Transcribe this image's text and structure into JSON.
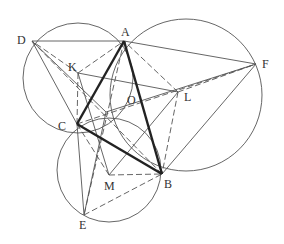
{
  "diagram": {
    "title": "",
    "colors": {
      "line": "#555555",
      "thick": "#222222",
      "text": "#333333",
      "background": "#ffffff"
    },
    "points": {
      "A": {
        "label": "A",
        "x": 124,
        "y": 41,
        "lx": 121,
        "ly": 36
      },
      "B": {
        "label": "B",
        "x": 162,
        "y": 174,
        "lx": 164,
        "ly": 188
      },
      "C": {
        "label": "C",
        "x": 77,
        "y": 124,
        "lx": 58,
        "ly": 130
      },
      "D": {
        "label": "D",
        "x": 32,
        "y": 41,
        "lx": 17,
        "ly": 44
      },
      "E": {
        "label": "E",
        "x": 84,
        "y": 215,
        "lx": 79,
        "ly": 229
      },
      "F": {
        "label": "F",
        "x": 256,
        "y": 64,
        "lx": 262,
        "ly": 68
      },
      "K": {
        "label": "K",
        "x": 78,
        "y": 73,
        "lx": 68,
        "ly": 71
      },
      "L": {
        "label": "L",
        "x": 178,
        "y": 92,
        "lx": 184,
        "ly": 101
      },
      "M": {
        "label": "M",
        "x": 109,
        "y": 175,
        "lx": 104,
        "ly": 190
      },
      "O": {
        "label": "O",
        "x": 106,
        "y": 112,
        "lx": 127,
        "ly": 104
      }
    },
    "circles": [
      {
        "name": "circle-ACD",
        "cx": 78,
        "cy": 78,
        "r": 55
      },
      {
        "name": "circle-ABF",
        "cx": 186,
        "cy": 95,
        "r": 76
      },
      {
        "name": "circle-BCE",
        "cx": 109,
        "cy": 170,
        "r": 52
      }
    ],
    "thick_segments": [
      [
        "A",
        "B"
      ],
      [
        "B",
        "C"
      ],
      [
        "C",
        "A"
      ]
    ],
    "solid_segments": [
      [
        "D",
        "A"
      ],
      [
        "A",
        "F"
      ],
      [
        "D",
        "C"
      ],
      [
        "C",
        "E"
      ],
      [
        "F",
        "B"
      ],
      [
        "K",
        "L"
      ],
      [
        "K",
        "M"
      ],
      [
        "M",
        "L"
      ],
      [
        "D",
        "O"
      ],
      [
        "F",
        "O"
      ],
      [
        "E",
        "O"
      ]
    ],
    "dashed_segments": [
      [
        "D",
        "B"
      ],
      [
        "A",
        "E"
      ],
      [
        "C",
        "F"
      ],
      [
        "K",
        "A"
      ],
      [
        "K",
        "C"
      ],
      [
        "L",
        "A"
      ],
      [
        "L",
        "B"
      ],
      [
        "M",
        "C"
      ],
      [
        "M",
        "B"
      ],
      [
        "E",
        "B"
      ],
      [
        "L",
        "F"
      ],
      [
        "K",
        "D"
      ]
    ]
  }
}
